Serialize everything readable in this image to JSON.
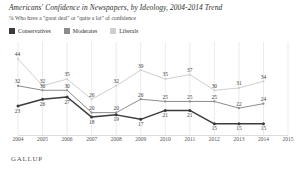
{
  "header": {
    "title": "Americans' Confidence in Newspapers, by Ideology, 2004-2014 Trend",
    "subtitle": "% Who have a \"great deal\" or \"quite a lot\" of confidence"
  },
  "legend": {
    "position": "top-left",
    "items": [
      {
        "label": "Conservatives",
        "color": "#3b3b3b"
      },
      {
        "label": "Moderates",
        "color": "#8c8c8c"
      },
      {
        "label": "Liberals",
        "color": "#cfcfcf"
      }
    ]
  },
  "footer": {
    "logo": "GALLUP"
  },
  "chart_data": {
    "type": "line",
    "title": "Americans' Confidence in Newspapers, by Ideology, 2004-2014 Trend",
    "subtitle": "% Who have a \"great deal\" or \"quite a lot\" of confidence",
    "xlabel": "",
    "ylabel": "",
    "ylim": [
      10,
      48
    ],
    "xlim": [
      2004,
      2015
    ],
    "grid": "vertical",
    "legend_position": "top-left",
    "categories": [
      2004,
      2005,
      2006,
      2007,
      2008,
      2009,
      2010,
      2011,
      2012,
      2013,
      2014
    ],
    "tick_labels": [
      "2004",
      "2005",
      "2006",
      "2007",
      "2008",
      "2009",
      "2010",
      "2011",
      "2012",
      "2013",
      "2014",
      "2015"
    ],
    "series": [
      {
        "name": "Conservatives",
        "color": "#3b3b3b",
        "values": [
          23,
          26,
          27,
          18,
          19,
          17,
          21,
          21,
          15,
          15,
          15
        ],
        "labels": [
          "23",
          "26",
          "27",
          "18",
          "19",
          "17",
          "21",
          "21",
          "15",
          "15",
          "15"
        ]
      },
      {
        "name": "Moderates",
        "color": "#8c8c8c",
        "values": [
          32,
          30,
          30,
          20,
          20,
          26,
          25,
          25,
          25,
          22,
          24
        ],
        "labels": [
          "32",
          "30",
          "30",
          "20",
          "20",
          "26",
          "25",
          "25",
          "25",
          "22",
          "24"
        ]
      },
      {
        "name": "Liberals",
        "color": "#cfcfcf",
        "values": [
          44,
          32,
          35,
          26,
          32,
          39,
          35,
          37,
          30,
          31,
          34
        ],
        "labels": [
          "44",
          "32",
          "35",
          "26",
          "32",
          "39",
          "35",
          "37",
          "30",
          "31",
          "34"
        ]
      }
    ]
  }
}
